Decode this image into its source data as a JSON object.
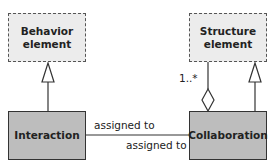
{
  "diagram": {
    "nodes": {
      "behavior_element": {
        "label": "Behavior element",
        "line1": "Behavior",
        "line2": "element",
        "style": "dashed"
      },
      "structure_element": {
        "label": "Structure element",
        "line1": "Structure",
        "line2": "element",
        "style": "dashed"
      },
      "interaction": {
        "label": "Interaction",
        "style": "solid"
      },
      "collaboration": {
        "label": "Collaboration",
        "style": "solid"
      }
    },
    "edges": {
      "interaction_to_behavior": {
        "type": "specialization"
      },
      "collaboration_to_structure_generalization": {
        "type": "specialization"
      },
      "collaboration_to_structure_aggregation": {
        "type": "aggregation",
        "multiplicity": "1..*"
      },
      "assignment_top": {
        "label": "assigned to"
      },
      "assignment_bottom": {
        "label": "assigned to"
      }
    },
    "colors": {
      "abstract_fill": "#ececec",
      "concrete_fill": "#bdbdbd",
      "line": "#333333"
    }
  }
}
